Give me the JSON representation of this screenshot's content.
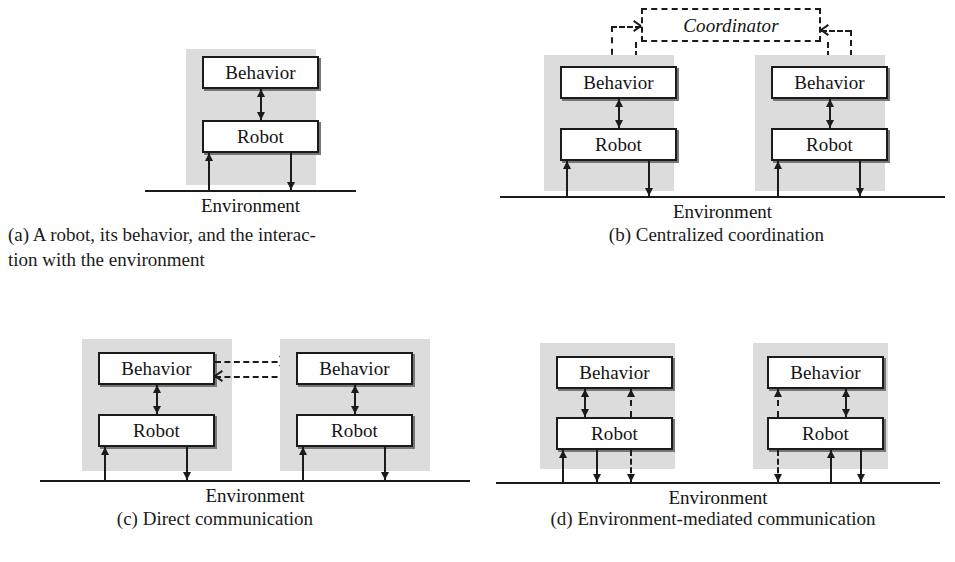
{
  "figure": {
    "module_labels": {
      "behavior": "Behavior",
      "robot": "Robot",
      "coordinator": "Coordinator"
    },
    "environment_label": "Environment",
    "colors": {
      "ink": "#1b1b1b",
      "shade": "#dcdcdc",
      "paper": "#ffffff",
      "shadow": "#777777"
    }
  },
  "panels": [
    {
      "id": "a",
      "caption_line1": "(a) A robot, its behavior, and the interac-",
      "caption_line2": "tion with the environment",
      "groups": 1,
      "boxes": [
        "Behavior",
        "Robot"
      ],
      "environment": "Environment"
    },
    {
      "id": "b",
      "caption_line1": "(b) Centralized coordination",
      "caption_line2": "",
      "groups": 2,
      "boxes": [
        "Behavior",
        "Robot"
      ],
      "coordinator": "Coordinator",
      "environment": "Environment"
    },
    {
      "id": "c",
      "caption_line1": "(c) Direct communication",
      "caption_line2": "",
      "groups": 2,
      "boxes": [
        "Behavior",
        "Robot"
      ],
      "environment": "Environment"
    },
    {
      "id": "d",
      "caption_line1": "(d) Environment-mediated communication",
      "caption_line2": "",
      "groups": 2,
      "boxes": [
        "Behavior",
        "Robot"
      ],
      "environment": "Environment"
    }
  ]
}
